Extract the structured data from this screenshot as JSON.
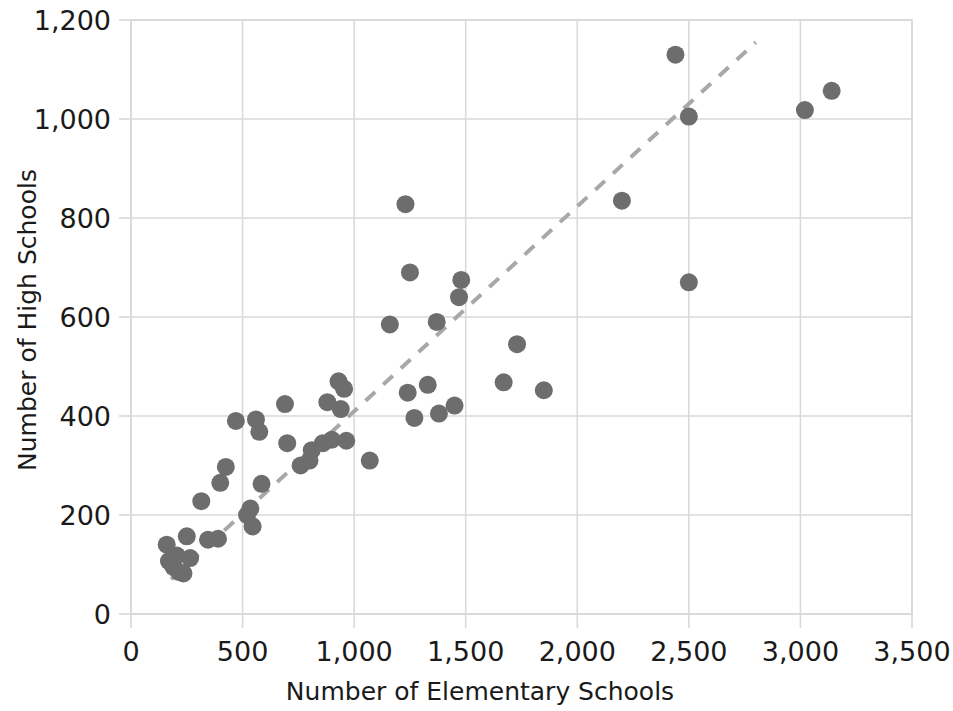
{
  "chart_data": {
    "type": "scatter",
    "title": "",
    "xlabel": "Number of Elementary Schools",
    "ylabel": "Number of High Schools",
    "xlim": [
      0,
      3500
    ],
    "ylim": [
      0,
      1200
    ],
    "xticks": [
      0,
      500,
      1000,
      1500,
      2000,
      2500,
      3000,
      3500
    ],
    "xticklabels": [
      "0",
      "500",
      "1,000",
      "1,500",
      "2,000",
      "2,500",
      "3,000",
      "3,500"
    ],
    "yticks": [
      0,
      200,
      400,
      600,
      800,
      1000,
      1200
    ],
    "yticklabels": [
      "0",
      "200",
      "400",
      "600",
      "800",
      "1,000",
      "1,200"
    ],
    "grid": true,
    "grid_color": "#d9d9d9",
    "marker_color": "#6d6d6d",
    "marker_size": 13,
    "trendline": {
      "style": "dashed",
      "color": "#a8a8a8",
      "x_start": 180,
      "y_start": 70,
      "x_end": 2800,
      "y_end": 1155
    },
    "legend": null,
    "points": [
      {
        "x": 160,
        "y": 140
      },
      {
        "x": 170,
        "y": 107
      },
      {
        "x": 190,
        "y": 95
      },
      {
        "x": 205,
        "y": 118
      },
      {
        "x": 215,
        "y": 85
      },
      {
        "x": 235,
        "y": 82
      },
      {
        "x": 250,
        "y": 157
      },
      {
        "x": 265,
        "y": 113
      },
      {
        "x": 315,
        "y": 228
      },
      {
        "x": 345,
        "y": 150
      },
      {
        "x": 390,
        "y": 152
      },
      {
        "x": 400,
        "y": 265
      },
      {
        "x": 425,
        "y": 297
      },
      {
        "x": 470,
        "y": 390
      },
      {
        "x": 520,
        "y": 200
      },
      {
        "x": 535,
        "y": 213
      },
      {
        "x": 545,
        "y": 177
      },
      {
        "x": 560,
        "y": 393
      },
      {
        "x": 575,
        "y": 368
      },
      {
        "x": 585,
        "y": 263
      },
      {
        "x": 690,
        "y": 424
      },
      {
        "x": 700,
        "y": 345
      },
      {
        "x": 760,
        "y": 300
      },
      {
        "x": 800,
        "y": 310
      },
      {
        "x": 810,
        "y": 331
      },
      {
        "x": 860,
        "y": 345
      },
      {
        "x": 880,
        "y": 428
      },
      {
        "x": 900,
        "y": 352
      },
      {
        "x": 930,
        "y": 470
      },
      {
        "x": 940,
        "y": 414
      },
      {
        "x": 955,
        "y": 455
      },
      {
        "x": 965,
        "y": 350
      },
      {
        "x": 1070,
        "y": 310
      },
      {
        "x": 1160,
        "y": 585
      },
      {
        "x": 1230,
        "y": 828
      },
      {
        "x": 1240,
        "y": 447
      },
      {
        "x": 1250,
        "y": 690
      },
      {
        "x": 1270,
        "y": 396
      },
      {
        "x": 1330,
        "y": 463
      },
      {
        "x": 1370,
        "y": 590
      },
      {
        "x": 1380,
        "y": 405
      },
      {
        "x": 1450,
        "y": 421
      },
      {
        "x": 1470,
        "y": 640
      },
      {
        "x": 1480,
        "y": 675
      },
      {
        "x": 1670,
        "y": 468
      },
      {
        "x": 1730,
        "y": 545
      },
      {
        "x": 1850,
        "y": 452
      },
      {
        "x": 2200,
        "y": 835
      },
      {
        "x": 2440,
        "y": 1130
      },
      {
        "x": 2500,
        "y": 1005
      },
      {
        "x": 2500,
        "y": 670
      },
      {
        "x": 3020,
        "y": 1018
      },
      {
        "x": 3140,
        "y": 1057
      }
    ]
  },
  "axes": {
    "x_title": "Number of Elementary Schools",
    "y_title": "Number of High Schools"
  }
}
